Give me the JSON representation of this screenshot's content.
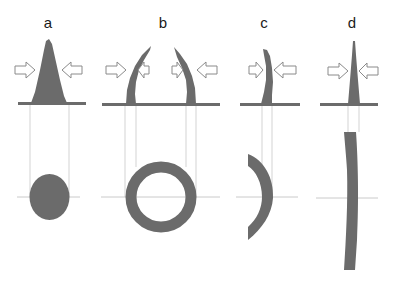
{
  "figure": {
    "panels": [
      {
        "id": "a",
        "label": "a",
        "profile": "broad-cone",
        "cross_section": "filled-circle"
      },
      {
        "id": "b",
        "label": "b",
        "profile": "paired-curved-walls",
        "cross_section": "ring"
      },
      {
        "id": "c",
        "label": "c",
        "profile": "curved-thin-wall",
        "cross_section": "arc-segment"
      },
      {
        "id": "d",
        "label": "d",
        "profile": "narrow-spike",
        "cross_section": "long-thin-arc"
      }
    ],
    "colors": {
      "shape_fill": "#6b6b6b",
      "guide_line": "#c8c8c8",
      "arrow_outline": "#8a8a8a",
      "background": "#ffffff"
    }
  }
}
